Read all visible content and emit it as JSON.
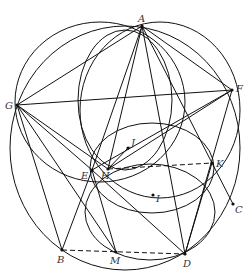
{
  "diagram": {
    "type": "geometry",
    "stroke_color": "#111111",
    "label_color": "#333333",
    "points": [
      {
        "name": "A",
        "x": 142,
        "y": 26,
        "lx": 138,
        "ly": 22
      },
      {
        "name": "F",
        "x": 232,
        "y": 90,
        "lx": 236,
        "ly": 92
      },
      {
        "name": "G",
        "x": 17,
        "y": 105,
        "lx": 5,
        "ly": 109
      },
      {
        "name": "J",
        "x": 128,
        "y": 148,
        "lx": 131,
        "ly": 146
      },
      {
        "name": "E",
        "x": 92,
        "y": 170,
        "lx": 81,
        "ly": 179
      },
      {
        "name": "H",
        "x": 108,
        "y": 169,
        "lx": 101,
        "ly": 179
      },
      {
        "name": "K",
        "x": 212,
        "y": 163,
        "lx": 216,
        "ly": 167
      },
      {
        "name": "I",
        "x": 153,
        "y": 195,
        "lx": 156,
        "ly": 202
      },
      {
        "name": "C",
        "x": 233,
        "y": 204,
        "lx": 235,
        "ly": 213
      },
      {
        "name": "B",
        "x": 62,
        "y": 250,
        "lx": 57,
        "ly": 263
      },
      {
        "name": "M",
        "x": 116,
        "y": 252,
        "lx": 110,
        "ly": 264
      },
      {
        "name": "D",
        "x": 185,
        "y": 254,
        "lx": 183,
        "ly": 267
      }
    ],
    "segments": [
      [
        "A",
        "G"
      ],
      [
        "A",
        "F"
      ],
      [
        "G",
        "F"
      ],
      [
        "A",
        "E"
      ],
      [
        "A",
        "H"
      ],
      [
        "A",
        "D"
      ],
      [
        "A",
        "K"
      ],
      [
        "G",
        "E"
      ],
      [
        "G",
        "H"
      ],
      [
        "G",
        "B"
      ],
      [
        "G",
        "M"
      ],
      [
        "F",
        "E"
      ],
      [
        "F",
        "H"
      ],
      [
        "F",
        "D"
      ],
      [
        "E",
        "B"
      ],
      [
        "E",
        "D"
      ],
      [
        "E",
        "M"
      ],
      [
        "K",
        "D"
      ],
      [
        "K",
        "C"
      ],
      [
        "H",
        "J"
      ]
    ],
    "dashed_segments": [
      [
        "H",
        "K"
      ],
      [
        "B",
        "D"
      ]
    ],
    "circles": [
      {
        "name": "circumcircle",
        "cx": 125,
        "cy": 148,
        "rx": 115,
        "ry": 122
      },
      {
        "name": "circle-AGE",
        "cx": 100,
        "cy": 102,
        "rx": 85,
        "ry": 80
      },
      {
        "name": "circle-AEF",
        "cx": 160,
        "cy": 110,
        "rx": 80,
        "ry": 88
      },
      {
        "name": "circle-inner",
        "cx": 125,
        "cy": 100,
        "rx": 47,
        "ry": 70
      },
      {
        "name": "circle-HK",
        "cx": 152,
        "cy": 168,
        "rx": 62,
        "ry": 45
      },
      {
        "name": "circle-EMD",
        "cx": 150,
        "cy": 212,
        "rx": 65,
        "ry": 48
      }
    ]
  }
}
